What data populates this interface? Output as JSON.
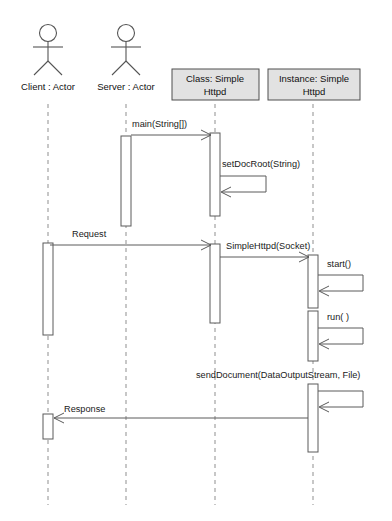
{
  "diagram": {
    "type": "uml-sequence-diagram",
    "background_color": "#ffffff",
    "line_color": "#5a5a5a",
    "lifeline_color": "#9a9a9a",
    "box_fill_color": "#e2e2e2"
  },
  "participants": [
    {
      "id": "client",
      "kind": "actor",
      "label": "Client : Actor",
      "label_line1": "Client : Actor",
      "label_line2": "",
      "x": 48
    },
    {
      "id": "server",
      "kind": "actor",
      "label": "Server : Actor",
      "label_line1": "Server : Actor",
      "label_line2": "",
      "x": 126
    },
    {
      "id": "class_simplehttpd",
      "kind": "object-box",
      "label": "Class: Simple Httpd",
      "label_line1": "Class: Simple",
      "label_line2": "Httpd",
      "x": 215
    },
    {
      "id": "instance_simplehttpd",
      "kind": "object-box",
      "label": "Instance: Simple Httpd",
      "label_line1": "Instance: Simple",
      "label_line2": "Httpd",
      "x": 313
    }
  ],
  "messages": [
    {
      "id": "msg-main",
      "label": "main(String[])",
      "from": "server",
      "to": "class_simplehttpd",
      "direction": "right",
      "kind": "call",
      "y": 133,
      "label_x": 132,
      "label_y": 127
    },
    {
      "id": "msg-setdocroot",
      "label": "setDocRoot(String)",
      "from": "class_simplehttpd",
      "to": "class_simplehttpd",
      "direction": "self",
      "kind": "self-call",
      "y": 186,
      "label_x": 222,
      "label_y": 166
    },
    {
      "id": "msg-request",
      "label": "Request",
      "from": "client",
      "to": "class_simplehttpd",
      "direction": "right",
      "kind": "call",
      "y": 243,
      "label_x": 72,
      "label_y": 236
    },
    {
      "id": "msg-simplehttpd-socket",
      "label": "SimpleHttpd(Socket)",
      "from": "class_simplehttpd",
      "to": "instance_simplehttpd",
      "direction": "right",
      "kind": "call",
      "y": 255,
      "label_x": 228,
      "label_y": 247
    },
    {
      "id": "msg-start",
      "label": "start()",
      "from": "instance_simplehttpd",
      "to": "instance_simplehttpd",
      "direction": "self",
      "kind": "self-call",
      "y": 285,
      "label_x": 329,
      "label_y": 265
    },
    {
      "id": "msg-run",
      "label": "run( )",
      "from": "instance_simplehttpd",
      "to": "instance_simplehttpd",
      "direction": "self",
      "kind": "self-call",
      "y": 340,
      "label_x": 329,
      "label_y": 318
    },
    {
      "id": "msg-senddocument",
      "label": "sendDocument(DataOutputStream, File)",
      "from": "instance_simplehttpd",
      "to": "instance_simplehttpd",
      "direction": "self",
      "kind": "self-call",
      "y": 402,
      "label_x": 196,
      "label_y": 375
    },
    {
      "id": "msg-response",
      "label": "Response",
      "from": "instance_simplehttpd",
      "to": "client",
      "direction": "left",
      "kind": "return",
      "y": 417,
      "label_x": 64,
      "label_y": 411
    }
  ],
  "activations": [
    {
      "id": "act-server",
      "participant": "server",
      "x": 126,
      "y": 138,
      "width": 10,
      "height": 88
    },
    {
      "id": "act-class-1",
      "participant": "class_simplehttpd",
      "x": 215,
      "y": 133,
      "width": 10,
      "height": 82
    },
    {
      "id": "act-class-2",
      "participant": "class_simplehttpd",
      "x": 215,
      "y": 245,
      "width": 10,
      "height": 78
    },
    {
      "id": "act-client",
      "participant": "client",
      "x": 48,
      "y": 243,
      "width": 10,
      "height": 90
    },
    {
      "id": "act-instance-1",
      "participant": "instance_simplehttpd",
      "x": 313,
      "y": 255,
      "width": 10,
      "height": 52
    },
    {
      "id": "act-instance-2",
      "participant": "instance_simplehttpd",
      "x": 313,
      "y": 310,
      "width": 10,
      "height": 50
    },
    {
      "id": "act-instance-3",
      "participant": "instance_simplehttpd",
      "x": 313,
      "y": 383,
      "width": 10,
      "height": 68
    },
    {
      "id": "act-client-return",
      "participant": "client",
      "x": 48,
      "y": 413,
      "width": 10,
      "height": 25
    }
  ]
}
